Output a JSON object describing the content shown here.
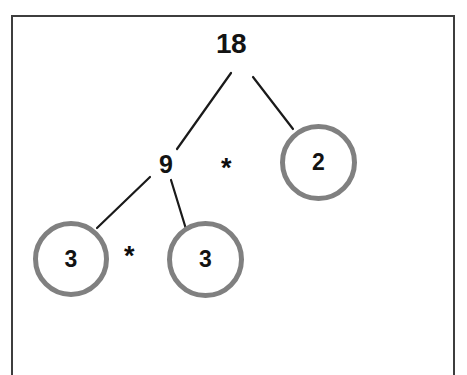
{
  "diagram": {
    "type": "factor-tree",
    "frame": {
      "border_color": "#3d3d3d"
    },
    "colors": {
      "circle_stroke": "#808080",
      "edge_stroke": "#1a1a1a",
      "text": "#131313",
      "background": "#ffffff"
    },
    "nodes": [
      {
        "id": "root",
        "label": "18",
        "shape": "plain",
        "x": 233,
        "y": 45
      },
      {
        "id": "nine",
        "label": "9",
        "shape": "plain",
        "x": 168,
        "y": 164
      },
      {
        "id": "two",
        "label": "2",
        "shape": "circle",
        "x": 318,
        "y": 162
      },
      {
        "id": "three-left",
        "label": "3",
        "shape": "circle",
        "x": 71,
        "y": 259
      },
      {
        "id": "three-right",
        "label": "3",
        "shape": "circle",
        "x": 205,
        "y": 259
      }
    ],
    "operators": [
      {
        "id": "op-upper",
        "label": "*",
        "x": 230,
        "y": 168
      },
      {
        "id": "op-lower",
        "label": "*",
        "x": 133,
        "y": 256
      }
    ],
    "edges": [
      {
        "from": "root",
        "to": "nine",
        "x1": 231,
        "y1": 73,
        "x2": 177,
        "y2": 149
      },
      {
        "from": "root",
        "to": "two",
        "x1": 253,
        "y1": 77,
        "x2": 293,
        "y2": 129
      },
      {
        "from": "nine",
        "to": "three-left",
        "x1": 150,
        "y1": 177,
        "x2": 97,
        "y2": 228
      },
      {
        "from": "nine",
        "to": "three-right",
        "x1": 171,
        "y1": 180,
        "x2": 186,
        "y2": 229
      }
    ]
  }
}
